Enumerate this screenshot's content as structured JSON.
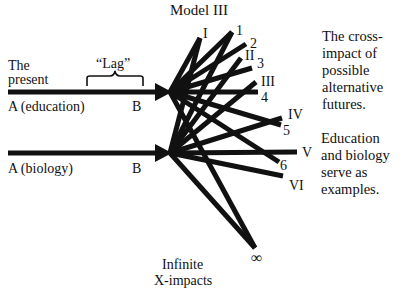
{
  "title": "Model III",
  "present_label": [
    "The",
    "present"
  ],
  "lag_label": "“Lag”",
  "rows": [
    {
      "start": "A (education)",
      "end": "B"
    },
    {
      "start": "A (biology)",
      "end": "B"
    }
  ],
  "futures_roman": [
    "I",
    "II",
    "III",
    "IV",
    "V",
    "VI"
  ],
  "futures_numeric": [
    "1",
    "2",
    "3",
    "4",
    "5",
    "6"
  ],
  "infinity_symbol": "∞",
  "infinite_label": [
    "Infinite",
    "X-impacts"
  ],
  "caption_1": [
    "The cross-",
    "impact of",
    "possible",
    "alternative",
    "futures."
  ],
  "caption_2": [
    "Education",
    "and biology",
    "serve as",
    "examples."
  ],
  "colors": {
    "ink": "#111111",
    "background": "#ffffff"
  }
}
